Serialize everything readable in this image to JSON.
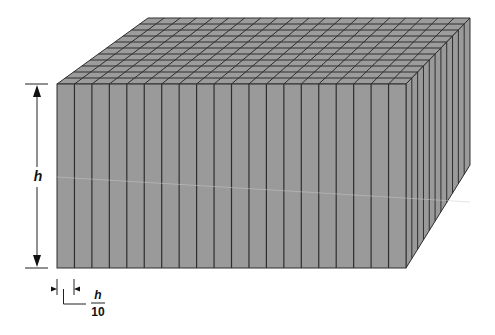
{
  "figure": {
    "width": 495,
    "height": 335
  },
  "block": {
    "front_face": {
      "x0": 57,
      "y0": 84,
      "x1": 406,
      "y1": 268
    },
    "top_back_left": {
      "x": 148,
      "y": 18
    },
    "top_back_right": {
      "x": 470,
      "y": 18
    },
    "right_back_bottom": {
      "x": 470,
      "y": 165
    },
    "front_columns": 20,
    "depth_divisions": 11,
    "fill_color": "#9a9a9a",
    "top_fill_color": "#9c9c9c",
    "line_color": "#2e2e2e"
  },
  "dimension_height": {
    "label": "h",
    "x": 37,
    "y_top": 84,
    "y_bottom": 268,
    "label_y": 181
  },
  "dimension_thickness": {
    "numerator": "h",
    "denominator": "10",
    "x_left": 57,
    "x_right": 74,
    "y": 289,
    "label_x": 98
  },
  "artifact_line_color": "#c8c8c8"
}
